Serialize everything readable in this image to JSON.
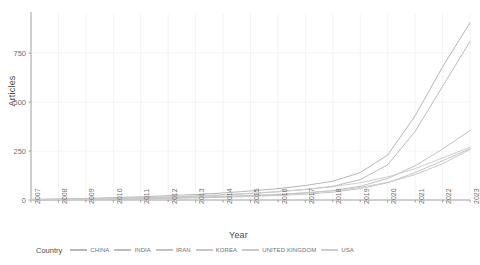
{
  "chart_data": {
    "type": "line",
    "title": "",
    "xlabel": "Year",
    "ylabel": "Articles",
    "xlim": [
      2007,
      2023
    ],
    "ylim": [
      0,
      950
    ],
    "yticks": [
      0,
      250,
      500,
      750
    ],
    "ytick_labels": [
      "0",
      "250",
      "500",
      "750"
    ],
    "grid": true,
    "legend_title": "Country",
    "legend_position": "bottom",
    "categories": [
      2007,
      2008,
      2009,
      2010,
      2011,
      2012,
      2013,
      2014,
      2015,
      2016,
      2017,
      2018,
      2019,
      2020,
      2021,
      2022,
      2023
    ],
    "tick_labels": [
      "2007",
      "2008",
      "2009",
      "2010",
      "2011",
      "2012",
      "2013",
      "2014",
      "2015",
      "2016",
      "2017",
      "2018",
      "2019",
      "2020",
      "2021",
      "2022",
      "2023"
    ],
    "series": [
      {
        "name": "CHINA",
        "color": "#b6b6b6",
        "values": [
          3,
          5,
          8,
          12,
          16,
          22,
          28,
          36,
          46,
          58,
          74,
          96,
          140,
          230,
          430,
          680,
          905
        ]
      },
      {
        "name": "INDIA",
        "color": "#bcbcbc",
        "values": [
          2,
          3,
          5,
          8,
          11,
          15,
          20,
          26,
          33,
          42,
          54,
          70,
          104,
          180,
          350,
          580,
          810
        ]
      },
      {
        "name": "IRAN",
        "color": "#c2c2c2",
        "values": [
          1,
          2,
          3,
          5,
          7,
          10,
          13,
          17,
          22,
          28,
          36,
          48,
          70,
          110,
          175,
          260,
          355
        ]
      },
      {
        "name": "KOREA",
        "color": "#c6c6c6",
        "values": [
          1,
          2,
          3,
          4,
          6,
          8,
          11,
          14,
          18,
          23,
          30,
          40,
          58,
          88,
          140,
          200,
          262
        ]
      },
      {
        "name": "UNITED KINGDOM",
        "color": "#cacaca",
        "values": [
          2,
          3,
          4,
          6,
          8,
          11,
          14,
          18,
          23,
          29,
          37,
          47,
          64,
          90,
          130,
          185,
          258
        ]
      },
      {
        "name": "USA",
        "color": "#cecece",
        "values": [
          3,
          4,
          6,
          9,
          12,
          16,
          21,
          27,
          34,
          43,
          54,
          68,
          88,
          118,
          160,
          215,
          270
        ]
      }
    ]
  },
  "plot": {
    "panel_background": "#ffffff",
    "grid_color": "#ebebeb",
    "axis_color": "#9a9a9a",
    "text_color": "#6f6f6f"
  }
}
